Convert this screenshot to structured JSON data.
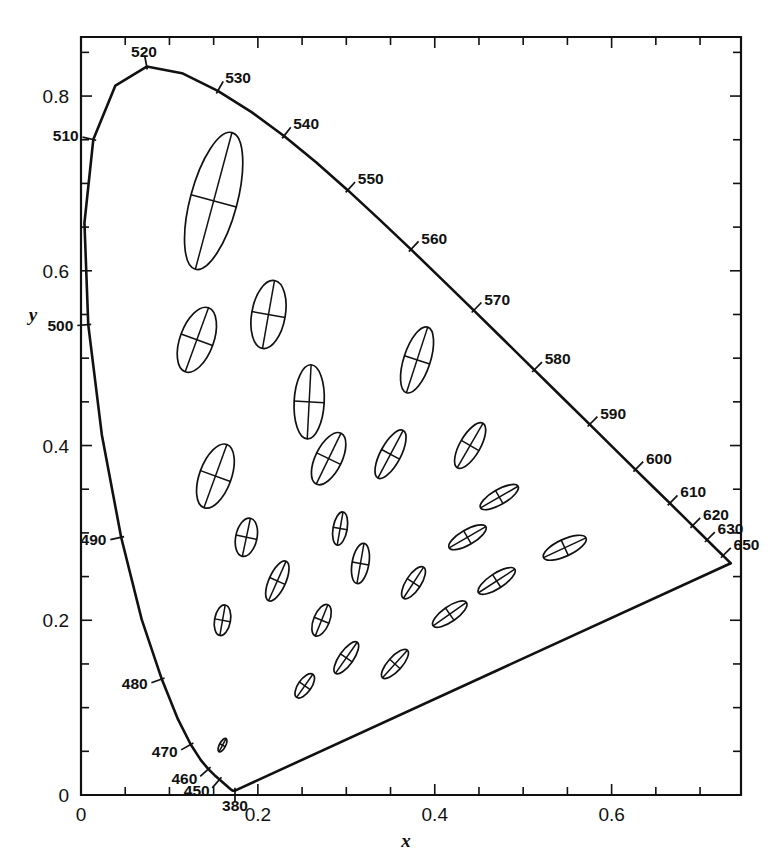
{
  "figure": {
    "type": "chromaticity-diagram",
    "background": "#ffffff",
    "ink": "#111111"
  },
  "axes": {
    "x_label": "x",
    "y_label": "y",
    "x_ticklabels": [
      "0",
      "0.2",
      "0.4",
      "0.6"
    ],
    "x_tickvalues": [
      0,
      0.2,
      0.4,
      0.6
    ],
    "y_ticklabels": [
      "0",
      "0.2",
      "0.4",
      "0.6",
      "0.8"
    ],
    "y_tickvalues": [
      0,
      0.2,
      0.4,
      0.6,
      0.8
    ],
    "x_minor_step": 0.05,
    "y_minor_step": 0.05,
    "xlim": [
      0,
      0.7463
    ],
    "ylim": [
      0,
      0.8676
    ]
  },
  "chart_data": {
    "type": "scatter",
    "title": "",
    "subtitle": "",
    "xlabel": "x",
    "ylabel": "y",
    "xlim": [
      0,
      0.7463
    ],
    "ylim": [
      0,
      0.8676
    ],
    "grid": false,
    "legend": "none",
    "annotations": [],
    "spectral_locus": {
      "name": "CIE 1931 spectral locus",
      "points": [
        [
          0.1741,
          0.005
        ],
        [
          0.174,
          0.005
        ],
        [
          0.1738,
          0.0049
        ],
        [
          0.1736,
          0.0049
        ],
        [
          0.1733,
          0.0048
        ],
        [
          0.173,
          0.0048
        ],
        [
          0.1726,
          0.0048
        ],
        [
          0.1721,
          0.0048
        ],
        [
          0.1714,
          0.0051
        ],
        [
          0.1703,
          0.0058
        ],
        [
          0.1689,
          0.0069
        ],
        [
          0.1669,
          0.0086
        ],
        [
          0.1644,
          0.0109
        ],
        [
          0.1611,
          0.0138
        ],
        [
          0.1566,
          0.0177
        ],
        [
          0.151,
          0.0227
        ],
        [
          0.144,
          0.0297
        ],
        [
          0.1355,
          0.0399
        ],
        [
          0.1241,
          0.0578
        ],
        [
          0.1096,
          0.0868
        ],
        [
          0.0913,
          0.1327
        ],
        [
          0.0687,
          0.2007
        ],
        [
          0.0454,
          0.295
        ],
        [
          0.0235,
          0.4127
        ],
        [
          0.0082,
          0.5384
        ],
        [
          0.0039,
          0.6548
        ],
        [
          0.0139,
          0.7502
        ],
        [
          0.0389,
          0.812
        ],
        [
          0.0743,
          0.8338
        ],
        [
          0.1142,
          0.8262
        ],
        [
          0.1547,
          0.8059
        ],
        [
          0.1929,
          0.7816
        ],
        [
          0.2296,
          0.7543
        ],
        [
          0.2658,
          0.7243
        ],
        [
          0.3016,
          0.6923
        ],
        [
          0.3373,
          0.6589
        ],
        [
          0.3731,
          0.6245
        ],
        [
          0.4087,
          0.5896
        ],
        [
          0.4441,
          0.5547
        ],
        [
          0.4788,
          0.5202
        ],
        [
          0.5125,
          0.4866
        ],
        [
          0.5448,
          0.4544
        ],
        [
          0.5752,
          0.4242
        ],
        [
          0.6029,
          0.3965
        ],
        [
          0.627,
          0.3725
        ],
        [
          0.6482,
          0.3514
        ],
        [
          0.6658,
          0.334
        ],
        [
          0.6801,
          0.3197
        ],
        [
          0.6915,
          0.3083
        ],
        [
          0.7006,
          0.2993
        ],
        [
          0.7079,
          0.292
        ],
        [
          0.714,
          0.2859
        ],
        [
          0.719,
          0.2809
        ],
        [
          0.723,
          0.277
        ],
        [
          0.726,
          0.274
        ],
        [
          0.7283,
          0.2717
        ],
        [
          0.73,
          0.27
        ],
        [
          0.7311,
          0.2689
        ],
        [
          0.732,
          0.268
        ],
        [
          0.7327,
          0.2673
        ],
        [
          0.7334,
          0.2666
        ],
        [
          0.734,
          0.266
        ],
        [
          0.7344,
          0.2656
        ],
        [
          0.7346,
          0.2654
        ],
        [
          0.7347,
          0.2653
        ]
      ]
    },
    "purple_line": {
      "name": "line of purples",
      "from": [
        0.7347,
        0.2653
      ],
      "to": [
        0.1741,
        0.005
      ]
    },
    "wavelength_labels": [
      {
        "text": "380",
        "x": 0.1741,
        "y": 0.005
      },
      {
        "text": "450",
        "x": 0.1566,
        "y": 0.0177
      },
      {
        "text": "460",
        "x": 0.144,
        "y": 0.0297
      },
      {
        "text": "470",
        "x": 0.1241,
        "y": 0.0578
      },
      {
        "text": "480",
        "x": 0.0913,
        "y": 0.1327
      },
      {
        "text": "490",
        "x": 0.0454,
        "y": 0.295
      },
      {
        "text": "500",
        "x": 0.0082,
        "y": 0.5384
      },
      {
        "text": "510",
        "x": 0.0139,
        "y": 0.7502
      },
      {
        "text": "520",
        "x": 0.0743,
        "y": 0.8338
      },
      {
        "text": "530",
        "x": 0.1547,
        "y": 0.8059
      },
      {
        "text": "540",
        "x": 0.2296,
        "y": 0.7543
      },
      {
        "text": "550",
        "x": 0.3016,
        "y": 0.6923
      },
      {
        "text": "560",
        "x": 0.3731,
        "y": 0.6245
      },
      {
        "text": "570",
        "x": 0.4441,
        "y": 0.5547
      },
      {
        "text": "580",
        "x": 0.5125,
        "y": 0.4866
      },
      {
        "text": "590",
        "x": 0.5752,
        "y": 0.4242
      },
      {
        "text": "600",
        "x": 0.627,
        "y": 0.3725
      },
      {
        "text": "610",
        "x": 0.6658,
        "y": 0.334
      },
      {
        "text": "620",
        "x": 0.6915,
        "y": 0.3083
      },
      {
        "text": "630",
        "x": 0.7079,
        "y": 0.292
      },
      {
        "text": "650",
        "x": 0.726,
        "y": 0.274
      }
    ],
    "ellipses": {
      "name": "MacAdam ellipses",
      "note": "axes drawn 10x actual standard-deviation size",
      "items": [
        {
          "cx": 0.16,
          "cy": 0.057,
          "a": 0.0085,
          "b": 0.0035,
          "angle": 62
        },
        {
          "cx": 0.187,
          "cy": 0.295,
          "a": 0.022,
          "b": 0.012,
          "angle": 78
        },
        {
          "cx": 0.253,
          "cy": 0.125,
          "a": 0.016,
          "b": 0.0075,
          "angle": 55
        },
        {
          "cx": 0.15,
          "cy": 0.68,
          "a": 0.08,
          "b": 0.0265,
          "angle": 75
        },
        {
          "cx": 0.131,
          "cy": 0.521,
          "a": 0.0385,
          "b": 0.019,
          "angle": 70
        },
        {
          "cx": 0.212,
          "cy": 0.55,
          "a": 0.039,
          "b": 0.019,
          "angle": 80
        },
        {
          "cx": 0.258,
          "cy": 0.45,
          "a": 0.042,
          "b": 0.017,
          "angle": 87
        },
        {
          "cx": 0.152,
          "cy": 0.365,
          "a": 0.038,
          "b": 0.018,
          "angle": 70
        },
        {
          "cx": 0.28,
          "cy": 0.385,
          "a": 0.032,
          "b": 0.015,
          "angle": 64
        },
        {
          "cx": 0.38,
          "cy": 0.498,
          "a": 0.039,
          "b": 0.015,
          "angle": 72
        },
        {
          "cx": 0.16,
          "cy": 0.2,
          "a": 0.0175,
          "b": 0.009,
          "angle": 80
        },
        {
          "cx": 0.293,
          "cy": 0.305,
          "a": 0.019,
          "b": 0.008,
          "angle": 80
        },
        {
          "cx": 0.222,
          "cy": 0.245,
          "a": 0.0245,
          "b": 0.0095,
          "angle": 66
        },
        {
          "cx": 0.35,
          "cy": 0.39,
          "a": 0.0305,
          "b": 0.0115,
          "angle": 62
        },
        {
          "cx": 0.44,
          "cy": 0.4,
          "a": 0.029,
          "b": 0.0115,
          "angle": 60
        },
        {
          "cx": 0.316,
          "cy": 0.265,
          "a": 0.023,
          "b": 0.0095,
          "angle": 80
        },
        {
          "cx": 0.272,
          "cy": 0.2,
          "a": 0.019,
          "b": 0.009,
          "angle": 68
        },
        {
          "cx": 0.3,
          "cy": 0.157,
          "a": 0.0215,
          "b": 0.008,
          "angle": 55
        },
        {
          "cx": 0.355,
          "cy": 0.15,
          "a": 0.021,
          "b": 0.008,
          "angle": 48
        },
        {
          "cx": 0.376,
          "cy": 0.243,
          "a": 0.021,
          "b": 0.0085,
          "angle": 57
        },
        {
          "cx": 0.417,
          "cy": 0.207,
          "a": 0.023,
          "b": 0.0085,
          "angle": 35
        },
        {
          "cx": 0.473,
          "cy": 0.341,
          "a": 0.0245,
          "b": 0.0085,
          "angle": 30
        },
        {
          "cx": 0.437,
          "cy": 0.295,
          "a": 0.024,
          "b": 0.0085,
          "angle": 30
        },
        {
          "cx": 0.47,
          "cy": 0.245,
          "a": 0.0245,
          "b": 0.0085,
          "angle": 33
        },
        {
          "cx": 0.547,
          "cy": 0.283,
          "a": 0.0265,
          "b": 0.0095,
          "angle": 25
        }
      ]
    }
  }
}
